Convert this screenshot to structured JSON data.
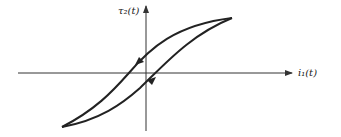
{
  "diagram": {
    "type": "hysteresis-loop",
    "axes": {
      "x_label": "i₁(t)",
      "y_label": "τ₂(t)"
    },
    "colors": {
      "stroke": "#222222",
      "axis": "#333333",
      "background": "#ffffff"
    },
    "loop": {
      "direction_arrows": [
        {
          "branch": "upper",
          "direction": "down-left"
        },
        {
          "branch": "lower",
          "direction": "up-right"
        }
      ]
    }
  }
}
